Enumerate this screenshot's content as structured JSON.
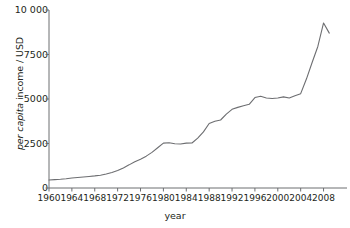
{
  "chart_data": {
    "type": "line",
    "title": "",
    "xlabel": "year",
    "ylabel": "per capita income / USD",
    "ylabel_italic_part": "per capita",
    "ylabel_roman_part": " income / USD",
    "xlim": [
      1960,
      2010
    ],
    "ylim": [
      0,
      10000
    ],
    "grid": false,
    "legend": "none",
    "line_color": "#6d6e71",
    "axis_color": "#6d6e71",
    "y_ticks": [
      {
        "value": 0,
        "label": "0"
      },
      {
        "value": 2500,
        "label": "2500"
      },
      {
        "value": 5000,
        "label": "5000"
      },
      {
        "value": 7500,
        "label": "7500"
      },
      {
        "value": 10000,
        "label": "10 000"
      }
    ],
    "x_ticks": [
      {
        "value": 1960,
        "label": "1960"
      },
      {
        "value": 1964,
        "label": "1964"
      },
      {
        "value": 1968,
        "label": "1968"
      },
      {
        "value": 1972,
        "label": "1972"
      },
      {
        "value": 1976,
        "label": "1976"
      },
      {
        "value": 1980,
        "label": "1980"
      },
      {
        "value": 1984,
        "label": "1984"
      },
      {
        "value": 1988,
        "label": "1988"
      },
      {
        "value": 1992,
        "label": "1992"
      },
      {
        "value": 1996,
        "label": "1996"
      },
      {
        "value": 2000,
        "label": "2000"
      },
      {
        "value": 2004,
        "label": "2004"
      },
      {
        "value": 2008,
        "label": "2008"
      }
    ],
    "x": [
      1960,
      1961,
      1962,
      1963,
      1964,
      1965,
      1966,
      1967,
      1968,
      1969,
      1970,
      1971,
      1972,
      1973,
      1974,
      1975,
      1976,
      1977,
      1978,
      1979,
      1980,
      1981,
      1982,
      1983,
      1984,
      1985,
      1986,
      1987,
      1988,
      1989,
      1990,
      1991,
      1992,
      1993,
      1994,
      1995,
      1996,
      1997,
      1998,
      1999,
      2000,
      2001,
      2002,
      2003,
      2004,
      2005,
      2006,
      2007,
      2008,
      2009
    ],
    "values": [
      450,
      470,
      490,
      520,
      560,
      590,
      620,
      650,
      680,
      720,
      790,
      870,
      980,
      1130,
      1300,
      1480,
      1620,
      1790,
      2000,
      2260,
      2520,
      2540,
      2490,
      2470,
      2520,
      2530,
      2800,
      3150,
      3620,
      3750,
      3820,
      4150,
      4420,
      4530,
      4620,
      4700,
      5080,
      5150,
      5060,
      5030,
      5060,
      5120,
      5060,
      5180,
      5300,
      6120,
      7050,
      7950,
      9270,
      8700
    ],
    "series_name": "per capita income"
  },
  "axis": {
    "y_title_italic": "per capita",
    "y_title_roman": " income / USD",
    "x_title": "year"
  }
}
